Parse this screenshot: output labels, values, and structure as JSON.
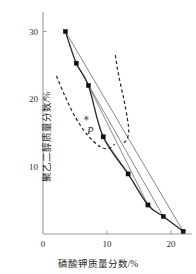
{
  "chart_data": {
    "type": "scatter",
    "title": "",
    "xlabel": "磷酸钾质量分数/%",
    "ylabel": "聚乙二醇质量分数/%",
    "xlim": [
      0,
      23
    ],
    "ylim": [
      0,
      32
    ],
    "xticks": [
      0,
      10,
      20
    ],
    "xtick_labels": [
      "0",
      "10",
      "20"
    ],
    "yticks": [
      10,
      20,
      30
    ],
    "ytick_labels": [
      "10",
      "20",
      "30"
    ],
    "grid": false,
    "legend": null,
    "series": [
      {
        "name": "binodal-curve",
        "style": "solid",
        "marker": "square",
        "x": [
          3.5,
          5.2,
          7.1,
          9.4,
          13.3,
          16.4,
          18.8,
          21.9
        ],
        "y": [
          30.0,
          25.3,
          22.0,
          14.4,
          8.9,
          4.3,
          2.6,
          0.4
        ]
      },
      {
        "name": "tie-line-1",
        "style": "solid",
        "marker": "none",
        "x": [
          3.5,
          21.9
        ],
        "y": [
          30.0,
          0.4
        ]
      },
      {
        "name": "tie-line-2",
        "style": "solid",
        "marker": "none",
        "x": [
          5.2,
          18.8
        ],
        "y": [
          25.3,
          2.6
        ]
      },
      {
        "name": "tie-line-3",
        "style": "solid",
        "marker": "none",
        "x": [
          7.1,
          16.4
        ],
        "y": [
          22.0,
          4.3
        ]
      },
      {
        "name": "tie-line-4",
        "style": "solid",
        "marker": "none",
        "x": [
          9.4,
          13.3
        ],
        "y": [
          14.4,
          8.9
        ]
      },
      {
        "name": "dashed-curve-left",
        "style": "dashed",
        "marker": "none",
        "x": [
          2.1,
          3.4,
          5.0,
          7.0,
          9.0,
          10.3,
          11.2
        ],
        "y": [
          23.4,
          20.5,
          17.4,
          14.6,
          12.9,
          12.7,
          13.3
        ]
      },
      {
        "name": "dashed-curve-right",
        "style": "dashed",
        "marker": "none",
        "x": [
          11.3,
          11.8,
          12.6,
          13.2,
          13.4,
          13.1,
          12.5
        ],
        "y": [
          26.5,
          23.6,
          20.1,
          17.0,
          15.2,
          14.0,
          13.4
        ]
      }
    ],
    "annotations": [
      {
        "text": "P",
        "x": 6.9,
        "y": 16.0,
        "style": "italic"
      },
      {
        "text": "✳",
        "x": 6.2,
        "y": 17.6,
        "style": "marker"
      }
    ]
  },
  "axes": {
    "x_title": "磷酸钾质量分数/%",
    "y_title": "聚乙二醇质量分数/%",
    "x_tick_labels": [
      "0",
      "10",
      "20"
    ],
    "y_tick_labels": [
      "10",
      "20",
      "30"
    ]
  },
  "colors": {
    "axis": "#9a9a9a",
    "curve": "#2a2a2a",
    "tie_line": "#7a7a7a",
    "dashed": "#222222",
    "marker": "#111111",
    "text": "#1f1f1f",
    "background": "#ffffff"
  }
}
